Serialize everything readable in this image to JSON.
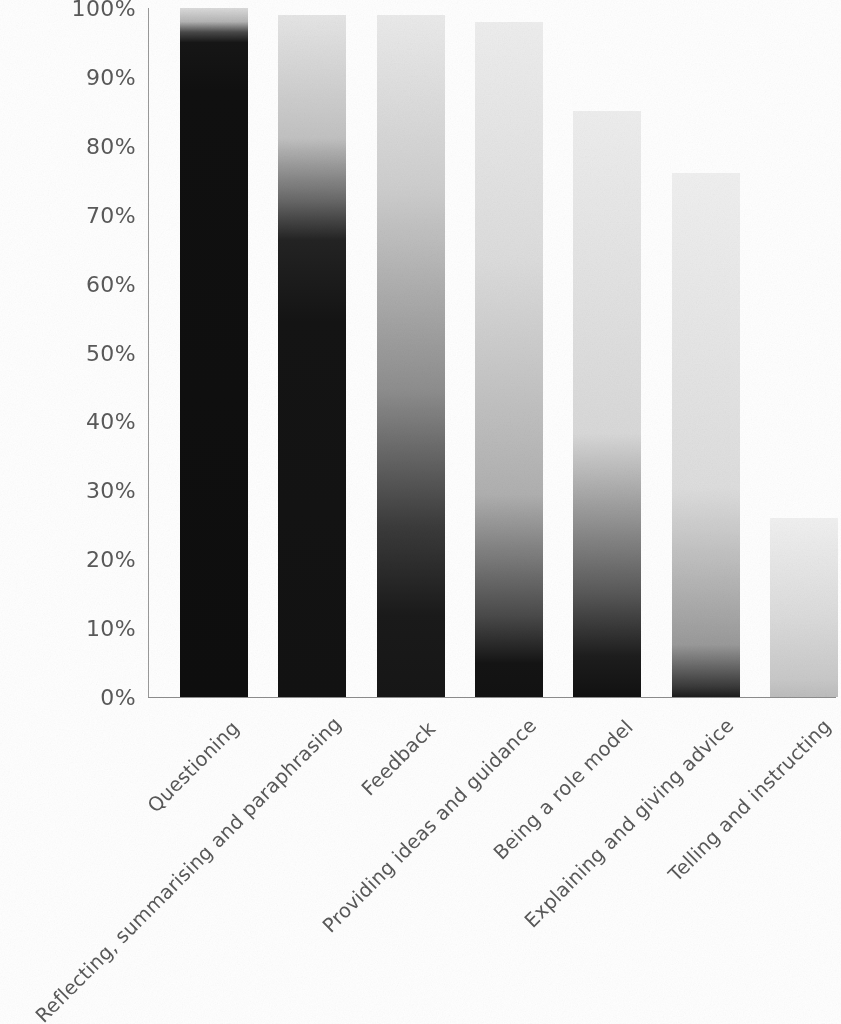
{
  "chart_data": {
    "type": "bar",
    "title": "",
    "subtitle": "",
    "xlabel": "",
    "ylabel": "",
    "ylim": [
      0,
      100
    ],
    "grid": false,
    "legend": false,
    "legend_position": "none",
    "y_tick_labels": [
      "100%",
      "90%",
      "80%",
      "70%",
      "60%",
      "50%",
      "40%",
      "30%",
      "20%",
      "10%",
      "0%"
    ],
    "y_tick_values": [
      100,
      90,
      80,
      70,
      60,
      50,
      40,
      30,
      20,
      10,
      0
    ],
    "categories": [
      "Questioning",
      "Reflecting, summarising and paraphrasing",
      "Feedback",
      "Providing ideas and guidance",
      "Being a role model",
      "Explaining and giving advice",
      "Telling and instructing"
    ],
    "values": [
      100,
      99,
      99,
      98,
      85,
      76,
      26
    ],
    "series": [
      {
        "name": "Percentage of respondents",
        "values": [
          100,
          99,
          99,
          98,
          85,
          76,
          26
        ]
      }
    ],
    "bar_colors": [
      "#1b1b1b",
      "#222222",
      "#2c2c2c",
      "#3a3a3a",
      "#2e2e2e",
      "#6a6a6a",
      "#8d8d8d"
    ],
    "axis_color": "#8d8d8d",
    "tick_label_color": "#5a5a5a",
    "background_color": "#ffffff"
  },
  "axis": {
    "ticks": [
      {
        "label": "100%",
        "value": 100
      },
      {
        "label": "90%",
        "value": 90
      },
      {
        "label": "80%",
        "value": 80
      },
      {
        "label": "70%",
        "value": 70
      },
      {
        "label": "60%",
        "value": 60
      },
      {
        "label": "50%",
        "value": 50
      },
      {
        "label": "40%",
        "value": 40
      },
      {
        "label": "30%",
        "value": 30
      },
      {
        "label": "20%",
        "value": 20
      },
      {
        "label": "10%",
        "value": 10
      },
      {
        "label": "0%",
        "value": 0
      }
    ]
  },
  "bars": [
    {
      "label": "Questioning",
      "value": 100
    },
    {
      "label": "Reflecting, summarising and paraphrasing",
      "value": 99
    },
    {
      "label": "Feedback",
      "value": 99
    },
    {
      "label": "Providing ideas and guidance",
      "value": 98
    },
    {
      "label": "Being a role model",
      "value": 85
    },
    {
      "label": "Explaining and giving advice",
      "value": 76
    },
    {
      "label": "Telling and instructing",
      "value": 26
    }
  ]
}
